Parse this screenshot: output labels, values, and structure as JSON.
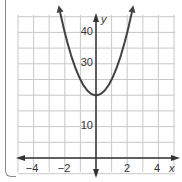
{
  "header": {
    "partial_text": "e.g. f(x) = ... y"
  },
  "chart_data": {
    "type": "line",
    "title": "",
    "function": "y = 5x^2 + 20",
    "xlabel": "x",
    "ylabel": "y",
    "xlim": [
      -5,
      5
    ],
    "ylim": [
      -5,
      45
    ],
    "x_ticks": [
      "−4",
      "−2",
      "2",
      "4"
    ],
    "y_ticks": [
      "10",
      "30",
      "40"
    ],
    "grid": true,
    "grid_x_step": 1,
    "grid_y_step": 5,
    "vertex": [
      0,
      20
    ],
    "x": [
      -2.4,
      -2,
      -1.5,
      -1,
      -0.5,
      0,
      0.5,
      1,
      1.5,
      2,
      2.4
    ],
    "series": [
      {
        "name": "parabola",
        "values": [
          48.8,
          40,
          31.25,
          25,
          21.25,
          20,
          21.25,
          25,
          31.25,
          40,
          48.8
        ]
      }
    ],
    "colors": {
      "curve": "#404040",
      "grid": "#c8c8c8",
      "axis": "#333333"
    }
  }
}
